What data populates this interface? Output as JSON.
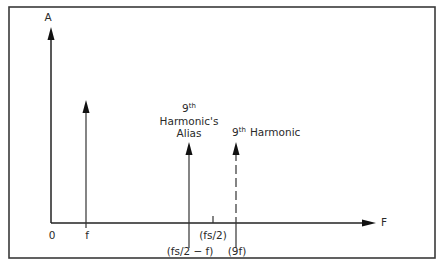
{
  "diagram": {
    "type": "frequency-spectrum",
    "y_axis_label": "A",
    "x_axis_label": "F",
    "origin_label": "0",
    "tick_labels": {
      "f": "f",
      "fs_half": "(fs/2)",
      "alias_freq": "(fs/2 − f)",
      "ninth_freq": "(9f)"
    },
    "annotations": {
      "alias_line1_num": "9",
      "alias_line1_sup": "th",
      "alias_line2": "Harmonic's",
      "alias_line3": "Alias",
      "harmonic_num": "9",
      "harmonic_sup": "th",
      "harmonic_text": "Harmonic"
    },
    "spectral_lines": [
      {
        "name": "fundamental",
        "x_label": "f",
        "style": "solid"
      },
      {
        "name": "9th-harmonic-alias",
        "x_label": "(fs/2 − f)",
        "style": "solid"
      },
      {
        "name": "9th-harmonic",
        "x_label": "(9f)",
        "style": "dashed"
      }
    ],
    "colors": {
      "stroke": "#222222",
      "background": "#ffffff"
    }
  }
}
